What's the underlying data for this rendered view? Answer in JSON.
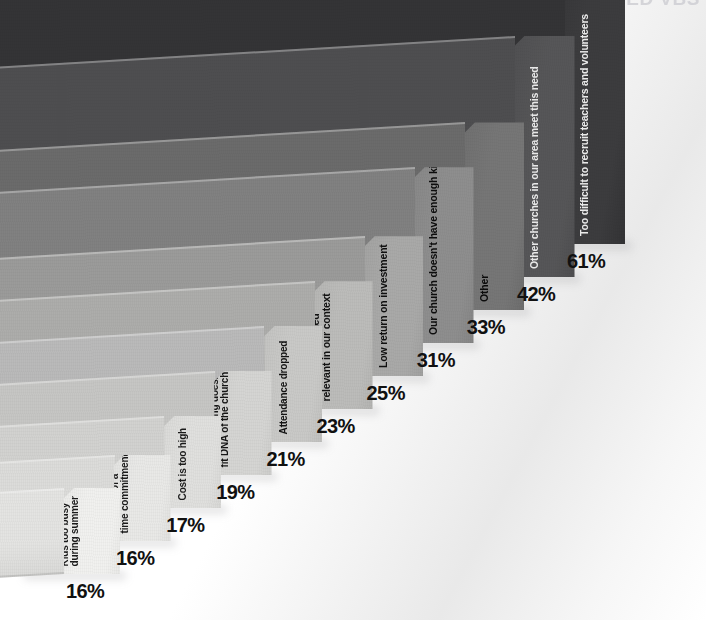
{
  "headline": {
    "text": "WHY CHURCHES DISCONTINUED VBS"
  },
  "chart_data": {
    "type": "bar",
    "title": "WHY CHURCHES DISCONTINUED VBS",
    "subtitle": "",
    "xlabel": "",
    "ylabel": "",
    "unit": "%",
    "orientation": "3d-perspective-horizontal-slabs",
    "grid": false,
    "legend": false,
    "xlim": [
      0,
      61
    ],
    "categories": [
      "Kids too busy during summer",
      "Too high of a time commitment",
      "Cost is too high",
      "Programming doesn't fit DNA of the church",
      "Attendance dropped",
      "No longer seemed relevant in our context",
      "Low return on investment",
      "Our church doesn't have enough kids",
      "Other",
      "Other churches in our area meet this need",
      "Too difficult to recruit teachers and volunteers"
    ],
    "values": [
      16,
      16,
      17,
      19,
      21,
      23,
      25,
      31,
      33,
      42,
      61
    ],
    "value_labels": [
      "16%",
      "16%",
      "17%",
      "19%",
      "21%",
      "23%",
      "25%",
      "31%",
      "33%",
      "42%",
      "61%"
    ]
  },
  "bars": [
    {
      "label": "Kids too busy during summer",
      "label_lines": [
        "Kids too busy",
        "during summer"
      ],
      "value": 16,
      "pct": "16%",
      "face_color": "#f1f1ef",
      "top_color": "#e4e4e2",
      "label_color": "#1a1a1a"
    },
    {
      "label": "Too high of a time commitment",
      "label_lines": [
        "Too high of a",
        "time commitment"
      ],
      "value": 16,
      "pct": "16%",
      "face_color": "#e9e9e7",
      "top_color": "#dcdcda",
      "label_color": "#1a1a1a"
    },
    {
      "label": "Cost is too high",
      "label_lines": [
        "Cost is too high"
      ],
      "value": 17,
      "pct": "17%",
      "face_color": "#e0e0de",
      "top_color": "#d2d2d0",
      "label_color": "#1a1a1a"
    },
    {
      "label": "Programming doesn't fit DNA of the church",
      "label_lines": [
        "Programming doesn't",
        "fit DNA of the church"
      ],
      "value": 19,
      "pct": "19%",
      "face_color": "#d5d5d3",
      "top_color": "#c6c6c4",
      "label_color": "#161616"
    },
    {
      "label": "Attendance dropped",
      "label_lines": [
        "Attendance dropped"
      ],
      "value": 21,
      "pct": "21%",
      "face_color": "#c9c9c7",
      "top_color": "#bababa",
      "label_color": "#141414"
    },
    {
      "label": "No longer seemed relevant in our context",
      "label_lines": [
        "No longer seemed",
        "relevant in our context"
      ],
      "value": 23,
      "pct": "23%",
      "face_color": "#bcbcba",
      "top_color": "#adadab",
      "label_color": "#121212"
    },
    {
      "label": "Low return on investment",
      "label_lines": [
        "Low return on investment"
      ],
      "value": 25,
      "pct": "25%",
      "face_color": "#a9a9a8",
      "top_color": "#9b9b9a",
      "label_color": "#101010"
    },
    {
      "label": "Our church doesn't have enough kids",
      "label_lines": [
        "Our church doesn't have enough kids"
      ],
      "value": 31,
      "pct": "31%",
      "face_color": "#8e8e8e",
      "top_color": "#818181",
      "label_color": "#0d0d0d"
    },
    {
      "label": "Other",
      "label_lines": [
        "Other"
      ],
      "value": 33,
      "pct": "33%",
      "face_color": "#767676",
      "top_color": "#6b6b6b",
      "label_color": "#0b0b0b"
    },
    {
      "label": "Other churches in our area meet this need",
      "label_lines": [
        "Other churches in our area meet this need"
      ],
      "value": 42,
      "pct": "42%",
      "face_color": "#565658",
      "top_color": "#4e4e50",
      "label_color": "#e8e8e8"
    },
    {
      "label": "Too difficult to recruit teachers and volunteers",
      "label_lines": [
        "Too difficult to recruit teachers and volunteers"
      ],
      "value": 61,
      "pct": "61%",
      "face_color": "#3c3c3e",
      "top_color": "#343436",
      "label_color": "#eaeaea"
    }
  ]
}
